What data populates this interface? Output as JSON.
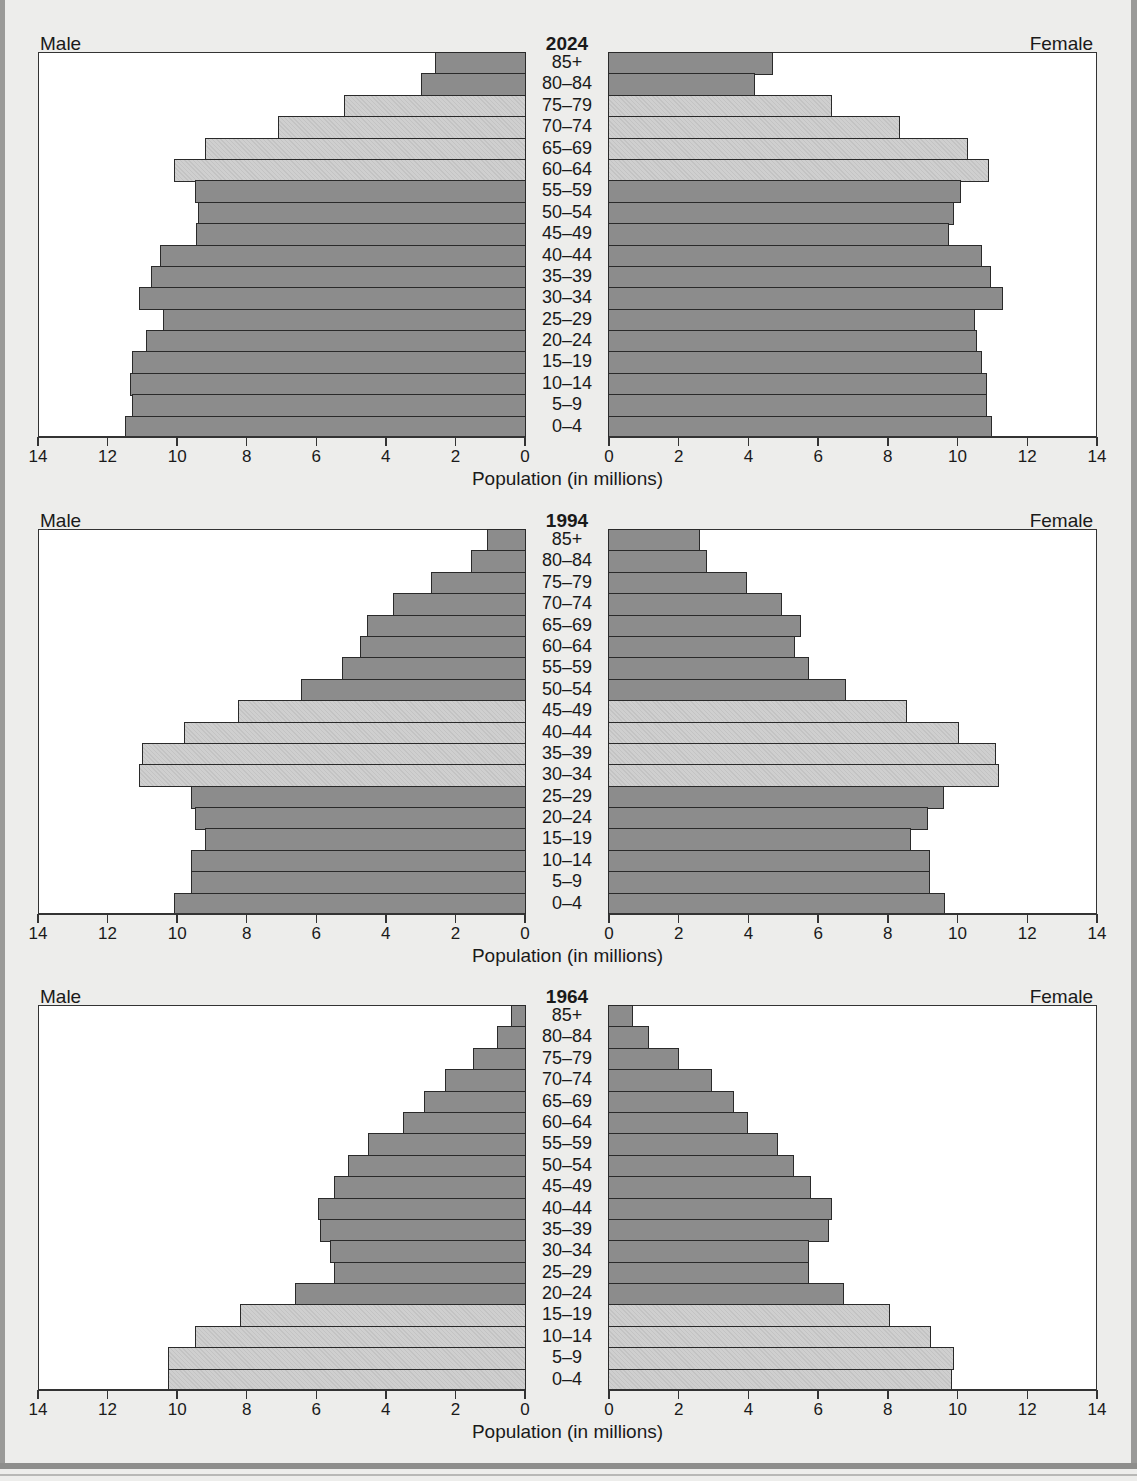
{
  "page": {
    "colors": {
      "background": "#ededeb",
      "dark_bar": "#8c8c8c",
      "light_bar": "#cfcfcf",
      "frame": "#9a9a98"
    }
  },
  "chart_data": [
    {
      "type": "bar",
      "orientation": "horizontal-population-pyramid",
      "title": "2024",
      "left_label": "Male",
      "right_label": "Female",
      "xlabel": "Population (in millions)",
      "xlim": [
        0,
        14
      ],
      "x_ticks": [
        0,
        2,
        4,
        6,
        8,
        10,
        12,
        14
      ],
      "categories": [
        "85+",
        "80–84",
        "75–79",
        "70–74",
        "65–69",
        "60–64",
        "55–59",
        "50–54",
        "45–49",
        "40–44",
        "35–39",
        "30–34",
        "25–29",
        "20–24",
        "15–19",
        "10–14",
        "5–9",
        "0–4"
      ],
      "highlighted": [
        "75–79",
        "70–74",
        "65–69",
        "60–64"
      ],
      "series": [
        {
          "name": "Male",
          "values": [
            2.6,
            3.0,
            5.2,
            7.1,
            9.2,
            10.1,
            9.5,
            9.4,
            9.45,
            10.5,
            10.75,
            11.1,
            10.4,
            10.9,
            11.3,
            11.35,
            11.3,
            11.5
          ]
        },
        {
          "name": "Female",
          "values": [
            4.7,
            4.2,
            6.4,
            8.35,
            10.3,
            10.9,
            10.1,
            9.9,
            9.75,
            10.7,
            10.95,
            11.3,
            10.5,
            10.55,
            10.7,
            10.85,
            10.85,
            11.0
          ]
        }
      ],
      "grid": false
    },
    {
      "type": "bar",
      "orientation": "horizontal-population-pyramid",
      "title": "1994",
      "left_label": "Male",
      "right_label": "Female",
      "xlabel": "Population (in millions)",
      "xlim": [
        0,
        14
      ],
      "x_ticks": [
        0,
        2,
        4,
        6,
        8,
        10,
        12,
        14
      ],
      "categories": [
        "85+",
        "80–84",
        "75–79",
        "70–74",
        "65–69",
        "60–64",
        "55–59",
        "50–54",
        "45–49",
        "40–44",
        "35–39",
        "30–34",
        "25–29",
        "20–24",
        "15–19",
        "10–14",
        "5–9",
        "0–4"
      ],
      "highlighted": [
        "45–49",
        "40–44",
        "35–39",
        "30–34"
      ],
      "series": [
        {
          "name": "Male",
          "values": [
            1.1,
            1.55,
            2.7,
            3.8,
            4.55,
            4.75,
            5.25,
            6.45,
            8.25,
            9.8,
            11.0,
            11.1,
            9.6,
            9.5,
            9.2,
            9.6,
            9.6,
            10.1
          ]
        },
        {
          "name": "Female",
          "values": [
            2.6,
            2.8,
            3.95,
            4.95,
            5.5,
            5.35,
            5.75,
            6.8,
            8.55,
            10.05,
            11.1,
            11.2,
            9.6,
            9.15,
            8.65,
            9.2,
            9.2,
            9.65
          ]
        }
      ],
      "grid": false
    },
    {
      "type": "bar",
      "orientation": "horizontal-population-pyramid",
      "title": "1964",
      "left_label": "Male",
      "right_label": "Female",
      "xlabel": "Population (in millions)",
      "xlim": [
        0,
        14
      ],
      "x_ticks": [
        0,
        2,
        4,
        6,
        8,
        10,
        12,
        14
      ],
      "categories": [
        "85+",
        "80–84",
        "75–79",
        "70–74",
        "65–69",
        "60–64",
        "55–59",
        "50–54",
        "45–49",
        "40–44",
        "35–39",
        "30–34",
        "25–29",
        "20–24",
        "15–19",
        "10–14",
        "5–9",
        "0–4"
      ],
      "highlighted": [
        "15–19",
        "10–14",
        "5–9",
        "0–4"
      ],
      "series": [
        {
          "name": "Male",
          "values": [
            0.4,
            0.8,
            1.5,
            2.3,
            2.9,
            3.5,
            4.5,
            5.1,
            5.5,
            5.95,
            5.9,
            5.6,
            5.5,
            6.6,
            8.2,
            9.5,
            10.25,
            10.25
          ]
        },
        {
          "name": "Female",
          "values": [
            0.7,
            1.15,
            2.0,
            2.95,
            3.6,
            4.0,
            4.85,
            5.3,
            5.8,
            6.4,
            6.3,
            5.75,
            5.75,
            6.75,
            8.05,
            9.25,
            9.9,
            9.85
          ]
        }
      ],
      "grid": false
    }
  ]
}
